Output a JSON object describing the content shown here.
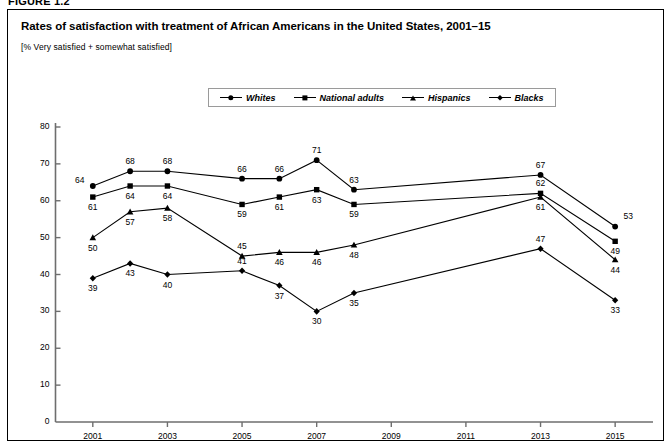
{
  "figure": {
    "number_label": "FIGURE 1.2",
    "title": "Rates of satisfaction with treatment of African Americans in the United States, 2001–15",
    "subtitle": "[% Very satisfied + somewhat satisfied]"
  },
  "legend": {
    "position": "top-center",
    "entries": [
      {
        "label": "Whites",
        "marker": "circle-marker-icon"
      },
      {
        "label": "National adults",
        "marker": "square-marker-icon"
      },
      {
        "label": "Hispanics",
        "marker": "triangle-marker-icon"
      },
      {
        "label": "Blacks",
        "marker": "diamond-marker-icon"
      }
    ]
  },
  "colors": {
    "line": "#000000",
    "marker": "#000000",
    "axis": "#6e6e6e",
    "frame": "#000000",
    "background": "#ffffff"
  },
  "chart_data": {
    "type": "line",
    "title": "Rates of satisfaction with treatment of African Americans in the United States, 2001–15",
    "subtitle": "[% Very satisfied + somewhat satisfied]",
    "xlabel": "",
    "ylabel": "",
    "xlim": [
      2000,
      2015.8
    ],
    "ylim": [
      0,
      80
    ],
    "ytick_step": 10,
    "yticks": [
      0,
      10,
      20,
      30,
      40,
      50,
      60,
      70,
      80
    ],
    "xticks": [
      2001,
      2003,
      2005,
      2007,
      2009,
      2011,
      2013,
      2015
    ],
    "xtick_labels": [
      "2001",
      "2003",
      "2005",
      "2007",
      "2009",
      "2011",
      "2013",
      "2015"
    ],
    "grid": false,
    "data_labels": true,
    "x": [
      2001,
      2002,
      2003,
      2005,
      2006,
      2007,
      2008,
      2013,
      2015
    ],
    "series": [
      {
        "name": "Whites",
        "marker": "circle",
        "values": [
          64,
          68,
          68,
          66,
          66,
          71,
          63,
          67,
          53
        ]
      },
      {
        "name": "National adults",
        "marker": "square",
        "values": [
          61,
          64,
          64,
          59,
          61,
          63,
          59,
          62,
          49
        ]
      },
      {
        "name": "Hispanics",
        "marker": "triangle",
        "values": [
          50,
          57,
          58,
          45,
          46,
          46,
          48,
          61,
          44
        ]
      },
      {
        "name": "Blacks",
        "marker": "diamond",
        "values": [
          39,
          43,
          40,
          41,
          37,
          30,
          35,
          47,
          33
        ]
      }
    ]
  }
}
